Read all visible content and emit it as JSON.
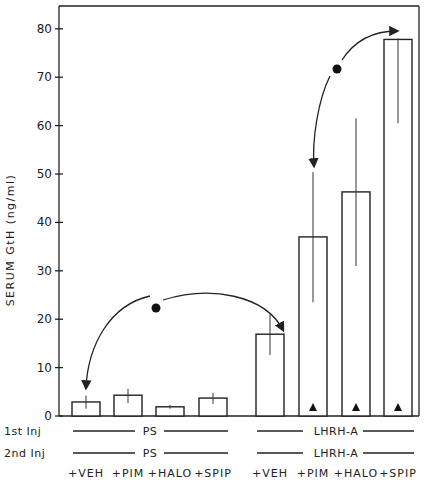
{
  "chart_data": {
    "type": "bar",
    "title": "",
    "xlabel": "",
    "ylabel": "SERUM GtH (ng/ml)",
    "ylim": [
      0,
      85
    ],
    "yticks": [
      0,
      10,
      20,
      30,
      40,
      50,
      60,
      70,
      80
    ],
    "grid": false,
    "legend": null,
    "categories": [
      "+VEH",
      "+PIM",
      "+HALO",
      "+SPIP",
      "+VEH",
      "+PIM",
      "+HALO",
      "+SPIP"
    ],
    "groups": [
      {
        "first_inj": "PS",
        "second_inj": "PS",
        "categories": [
          "+VEH",
          "+PIM",
          "+HALO",
          "+SPIP"
        ]
      },
      {
        "first_inj": "LHRH-A",
        "second_inj": "LHRH-A",
        "categories": [
          "+VEH",
          "+PIM",
          "+HALO",
          "+SPIP"
        ]
      }
    ],
    "values": [
      2.9,
      4.3,
      1.9,
      3.7,
      16.9,
      37.0,
      46.3,
      77.8
    ],
    "error_low": [
      1.5,
      2.7,
      1.5,
      2.5,
      12.6,
      23.5,
      31.0,
      60.5
    ],
    "error_high": [
      4.2,
      5.6,
      2.3,
      4.8,
      21.0,
      50.4,
      61.5,
      78.0
    ],
    "significance_markers": [
      {
        "category_index": 5,
        "symbol": "▲"
      },
      {
        "category_index": 6,
        "symbol": "▲"
      },
      {
        "category_index": 7,
        "symbol": "▲"
      }
    ],
    "annotations": [
      {
        "type": "double-arrow",
        "from_index": 0,
        "to_index": 4,
        "symbol": "●",
        "meaning": "significant difference"
      },
      {
        "type": "double-arrow",
        "from_index": 5,
        "to_index": 7,
        "symbol": "●",
        "meaning": "significant difference"
      }
    ],
    "row_labels": {
      "first": "1st Inj",
      "second": "2nd Inj"
    }
  }
}
